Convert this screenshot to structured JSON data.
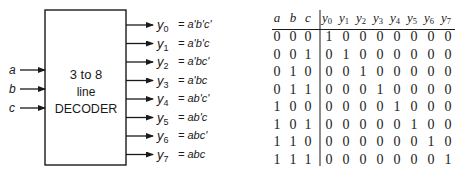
{
  "decoder": {
    "title_line1": "3 to 8",
    "title_line2": "line",
    "title_line3": "DECODER",
    "inputs": [
      {
        "label": "a"
      },
      {
        "label": "b"
      },
      {
        "label": "c"
      }
    ],
    "outputs": [
      {
        "name": "y",
        "sub": "0",
        "expr": "= a'b'c'"
      },
      {
        "name": "y",
        "sub": "1",
        "expr": "= a'b'c"
      },
      {
        "name": "y",
        "sub": "2",
        "expr": "= a'bc'"
      },
      {
        "name": "y",
        "sub": "3",
        "expr": "= a'bc"
      },
      {
        "name": "y",
        "sub": "4",
        "expr": "= ab'c'"
      },
      {
        "name": "y",
        "sub": "5",
        "expr": "= ab'c"
      },
      {
        "name": "y",
        "sub": "6",
        "expr": "= abc'"
      },
      {
        "name": "y",
        "sub": "7",
        "expr": "= abc"
      }
    ]
  },
  "truth_table": {
    "input_headers": [
      "a",
      "b",
      "c"
    ],
    "output_headers": [
      {
        "name": "y",
        "sub": "0"
      },
      {
        "name": "y",
        "sub": "1"
      },
      {
        "name": "y",
        "sub": "2"
      },
      {
        "name": "y",
        "sub": "3"
      },
      {
        "name": "y",
        "sub": "4"
      },
      {
        "name": "y",
        "sub": "5"
      },
      {
        "name": "y",
        "sub": "6"
      },
      {
        "name": "y",
        "sub": "7"
      }
    ],
    "rows": [
      {
        "in": [
          "0",
          "0",
          "0"
        ],
        "out": [
          "1",
          "0",
          "0",
          "0",
          "0",
          "0",
          "0",
          "0"
        ]
      },
      {
        "in": [
          "0",
          "0",
          "1"
        ],
        "out": [
          "0",
          "1",
          "0",
          "0",
          "0",
          "0",
          "0",
          "0"
        ]
      },
      {
        "in": [
          "0",
          "1",
          "0"
        ],
        "out": [
          "0",
          "0",
          "1",
          "0",
          "0",
          "0",
          "0",
          "0"
        ]
      },
      {
        "in": [
          "0",
          "1",
          "1"
        ],
        "out": [
          "0",
          "0",
          "0",
          "1",
          "0",
          "0",
          "0",
          "0"
        ]
      },
      {
        "in": [
          "1",
          "0",
          "0"
        ],
        "out": [
          "0",
          "0",
          "0",
          "0",
          "1",
          "0",
          "0",
          "0"
        ]
      },
      {
        "in": [
          "1",
          "0",
          "1"
        ],
        "out": [
          "0",
          "0",
          "0",
          "0",
          "0",
          "1",
          "0",
          "0"
        ]
      },
      {
        "in": [
          "1",
          "1",
          "0"
        ],
        "out": [
          "0",
          "0",
          "0",
          "0",
          "0",
          "0",
          "1",
          "0"
        ]
      },
      {
        "in": [
          "1",
          "1",
          "1"
        ],
        "out": [
          "0",
          "0",
          "0",
          "0",
          "0",
          "0",
          "0",
          "1"
        ]
      }
    ]
  }
}
